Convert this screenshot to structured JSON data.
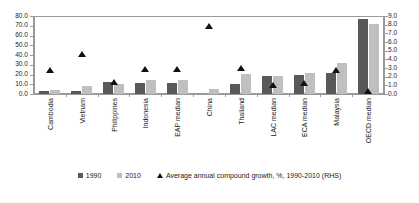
{
  "chart_data": {
    "type": "bar",
    "title": "",
    "xlabel": "",
    "ylabel": "",
    "ylabel_right": "",
    "grid": false,
    "legend_position": "bottom",
    "ylim": [
      0,
      80
    ],
    "ylim_right": [
      0,
      9
    ],
    "yticks": [
      "0.0",
      "10.0",
      "20.0",
      "30.0",
      "40.0",
      "50.0",
      "60.0",
      "70.0",
      "80.0"
    ],
    "yticks_right": [
      "0.0",
      "1.0",
      "2.0",
      "3.0",
      "4.0",
      "5.0",
      "6.0",
      "7.0",
      "8.0",
      "9.0"
    ],
    "categories": [
      "Cambodia",
      "Vietnam",
      "Philippines",
      "Indonesia",
      "EAP median",
      "China",
      "Thailand",
      "LAC median",
      "ECA median",
      "Malaysia",
      "OECD median"
    ],
    "series": [
      {
        "name": "1990",
        "axis": "left",
        "color": "#595959",
        "values": [
          3.2,
          2.8,
          12.8,
          11.5,
          11.5,
          0.0,
          10.5,
          18.6,
          19.0,
          21.5,
          77.0
        ]
      },
      {
        "name": "2010",
        "axis": "left",
        "color": "#bfbfbf",
        "values": [
          4.5,
          7.8,
          10.5,
          14.2,
          14.8,
          5.0,
          20.5,
          18.5,
          22.0,
          31.5,
          72.0
        ]
      },
      {
        "name": "Average annual compound growth, %, 1990-2010 (RHS)",
        "axis": "right",
        "type": "scatter",
        "marker": "triangle",
        "color": "#111111",
        "values": [
          2.8,
          4.6,
          1.4,
          2.9,
          2.9,
          7.8,
          3.0,
          1.0,
          1.3,
          2.8,
          0.3
        ]
      }
    ]
  },
  "legend": {
    "items": [
      {
        "label": "1990",
        "marker": "square-dark"
      },
      {
        "label": "2010",
        "marker": "square-light"
      },
      {
        "label": "Average annual compound growth, %, 1990-2010 (RHS)",
        "marker": "triangle"
      }
    ]
  },
  "note": {
    "text": ""
  }
}
